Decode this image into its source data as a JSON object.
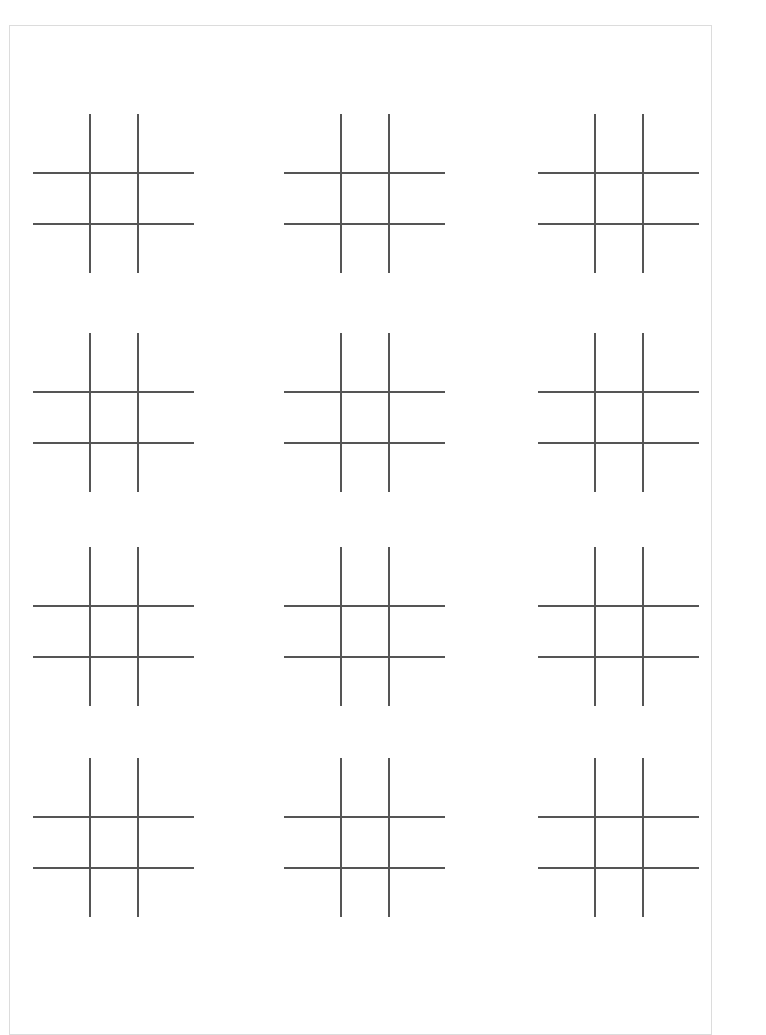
{
  "document": {
    "kind": "worksheet",
    "title": "Tic Tac Toe Grid Worksheet",
    "page_background": "#ffffff",
    "sheet_background": "#ffffff",
    "sheet_border_color": "#dcdcdc",
    "line_color": "#555555",
    "line_width_px": 1.5,
    "board_count": 12,
    "board_rows": 4,
    "board_columns": 3
  },
  "sheet": {
    "left": 9,
    "top": 25,
    "width": 703,
    "height": 1010
  },
  "boards": [
    {
      "id": "board-r1c1",
      "row": 1,
      "column": 1,
      "label": "Tic tac toe grid row 1 column 1",
      "cells": [
        "",
        "",
        "",
        "",
        "",
        "",
        "",
        "",
        ""
      ]
    },
    {
      "id": "board-r1c2",
      "row": 1,
      "column": 2,
      "label": "Tic tac toe grid row 1 column 2",
      "cells": [
        "",
        "",
        "",
        "",
        "",
        "",
        "",
        "",
        ""
      ]
    },
    {
      "id": "board-r1c3",
      "row": 1,
      "column": 3,
      "label": "Tic tac toe grid row 1 column 3",
      "cells": [
        "",
        "",
        "",
        "",
        "",
        "",
        "",
        "",
        ""
      ]
    },
    {
      "id": "board-r2c1",
      "row": 2,
      "column": 1,
      "label": "Tic tac toe grid row 2 column 1",
      "cells": [
        "",
        "",
        "",
        "",
        "",
        "",
        "",
        "",
        ""
      ]
    },
    {
      "id": "board-r2c2",
      "row": 2,
      "column": 2,
      "label": "Tic tac toe grid row 2 column 2",
      "cells": [
        "",
        "",
        "",
        "",
        "",
        "",
        "",
        "",
        ""
      ]
    },
    {
      "id": "board-r2c3",
      "row": 2,
      "column": 3,
      "label": "Tic tac toe grid row 2 column 3",
      "cells": [
        "",
        "",
        "",
        "",
        "",
        "",
        "",
        "",
        ""
      ]
    },
    {
      "id": "board-r3c1",
      "row": 3,
      "column": 1,
      "label": "Tic tac toe grid row 3 column 1",
      "cells": [
        "",
        "",
        "",
        "",
        "",
        "",
        "",
        "",
        ""
      ]
    },
    {
      "id": "board-r3c2",
      "row": 3,
      "column": 2,
      "label": "Tic tac toe grid row 3 column 2",
      "cells": [
        "",
        "",
        "",
        "",
        "",
        "",
        "",
        "",
        ""
      ]
    },
    {
      "id": "board-r3c3",
      "row": 3,
      "column": 3,
      "label": "Tic tac toe grid row 3 column 3",
      "cells": [
        "",
        "",
        "",
        "",
        "",
        "",
        "",
        "",
        ""
      ]
    },
    {
      "id": "board-r4c1",
      "row": 4,
      "column": 1,
      "label": "Tic tac toe grid row 4 column 1",
      "cells": [
        "",
        "",
        "",
        "",
        "",
        "",
        "",
        "",
        ""
      ]
    },
    {
      "id": "board-r4c2",
      "row": 4,
      "column": 2,
      "label": "Tic tac toe grid row 4 column 2",
      "cells": [
        "",
        "",
        "",
        "",
        "",
        "",
        "",
        "",
        ""
      ]
    },
    {
      "id": "board-r4c3",
      "row": 4,
      "column": 3,
      "label": "Tic tac toe grid row 4 column 3",
      "cells": [
        "",
        "",
        "",
        "",
        "",
        "",
        "",
        "",
        ""
      ]
    }
  ],
  "board_geometry": {
    "vertical_line_x": [
      57,
      105
    ],
    "vertical_line_y_start": 0,
    "vertical_line_y_end": 159,
    "horizontal_line_y": [
      59,
      110
    ],
    "horizontal_line_x_start": 0,
    "horizontal_line_x_end": 161
  }
}
